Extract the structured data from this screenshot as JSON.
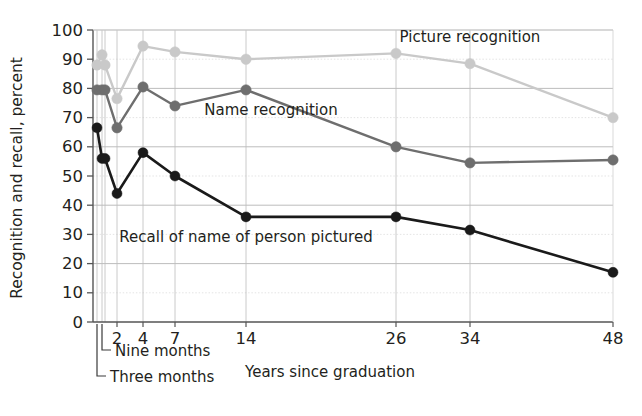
{
  "chart_data": {
    "type": "line",
    "title": "",
    "xlabel": "Years since graduation",
    "ylabel": "Recognition and recall, percent",
    "ylim": [
      0,
      100
    ],
    "yticks": [
      0,
      10,
      20,
      30,
      40,
      50,
      60,
      70,
      80,
      90,
      100
    ],
    "x_positions": [
      0.25,
      0.75,
      1,
      2,
      4,
      7,
      14,
      26,
      34,
      48
    ],
    "xtick_labels": [
      "2",
      "4",
      "7",
      "14",
      "26",
      "34",
      "48"
    ],
    "xtick_values": [
      2,
      4,
      7,
      14,
      26,
      34,
      48
    ],
    "annotations": [
      {
        "text": "Nine months",
        "x_value": 0.75
      },
      {
        "text": "Three months",
        "x_value": 0.25
      }
    ],
    "grid": "both",
    "legend_position": "inline-labels",
    "series": [
      {
        "name": "Picture recognition",
        "color": "#c9c9c9",
        "label_x": 34,
        "label_y": 96,
        "values": [
          88,
          91.5,
          88,
          76.5,
          94.5,
          92.5,
          90,
          92,
          88.5,
          70
        ]
      },
      {
        "name": "Name recognition",
        "color": "#6e6e6e",
        "label_x": 16,
        "label_y": 71,
        "values": [
          79.5,
          79.5,
          79.5,
          66.5,
          80.5,
          74,
          79.5,
          60,
          54.5,
          55.5
        ]
      },
      {
        "name": "Recall of name of person pictured",
        "color": "#1a1a1a",
        "label_x": 14,
        "label_y": 27.5,
        "values": [
          66.5,
          56,
          56,
          44,
          58,
          50,
          36,
          36,
          31.5,
          17
        ]
      }
    ]
  }
}
